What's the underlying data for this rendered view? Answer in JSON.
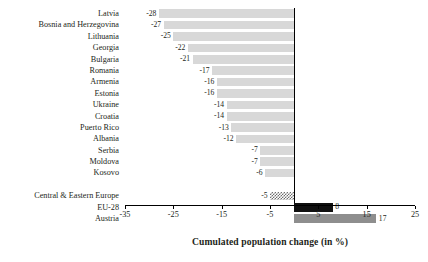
{
  "chart_data": {
    "type": "bar",
    "orientation": "horizontal",
    "title": "",
    "xlabel": "Cumulated population change (in %)",
    "ylabel": "",
    "xlim": [
      -35,
      25
    ],
    "xticks": [
      -35,
      -25,
      -15,
      -5,
      5,
      15,
      25
    ],
    "grid": false,
    "legend": "none",
    "categories": [
      "Latvia",
      "Bosnia and Herzegovina",
      "Lithuania",
      "Georgia",
      "Bulgaria",
      "Romania",
      "Armenia",
      "Estonia",
      "Ukraine",
      "Croatia",
      "Puerto Rico",
      "Albania",
      "Serbia",
      "Moldova",
      "Kosovo",
      "",
      "Central & Eastern Europe",
      "EU-28",
      "Austria"
    ],
    "values": [
      -28,
      -27,
      -25,
      -22,
      -21,
      -17,
      -16,
      -16,
      -14,
      -14,
      -13,
      -12,
      -7,
      -7,
      -6,
      null,
      -5,
      8,
      17
    ],
    "value_labels": [
      "-28",
      "-27",
      "-25",
      "-22",
      "-21",
      "-17",
      "-16",
      "-16",
      "-14",
      "-14",
      "-13",
      "-12",
      "-7",
      "-7",
      "-6",
      "",
      "-5",
      "8",
      "17"
    ],
    "bar_styles": [
      "light",
      "light",
      "light",
      "light",
      "light",
      "light",
      "light",
      "light",
      "light",
      "light",
      "light",
      "light",
      "light",
      "light",
      "light",
      "none",
      "checker",
      "dark",
      "mid"
    ],
    "colors": {
      "light": "#d8d8d8",
      "mid": "#8e8e8e",
      "dark": "#101010",
      "checker": "#6f6f6f",
      "axis": "#000000",
      "text": "#231f20"
    }
  }
}
